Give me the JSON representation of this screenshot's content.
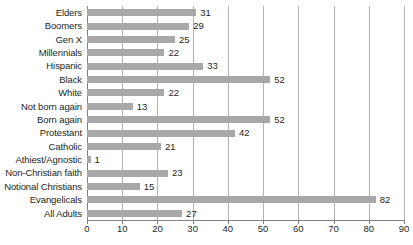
{
  "chart_data": {
    "type": "bar",
    "orientation": "horizontal",
    "title": "",
    "subtitle": "",
    "xlabel": "",
    "ylabel": "",
    "xlim": [
      0,
      90
    ],
    "xticks": [
      0,
      10,
      20,
      30,
      40,
      50,
      60,
      70,
      80,
      90
    ],
    "grid": true,
    "legend": false,
    "bar_color": "#a8a8a8",
    "text_color": "#231f20",
    "gridline_color": "#b3b3b3",
    "axis_color": "#808080",
    "categories": [
      "Elders",
      "Boomers",
      "Gen X",
      "Millennials",
      "Hispanic",
      "Black",
      "White",
      "Not born again",
      "Born again",
      "Protestant",
      "Catholic",
      "Athiest/Agnostic",
      "Non-Christian faith",
      "Notional Christians",
      "Evangelicals",
      "All Adults"
    ],
    "values": [
      31,
      29,
      25,
      22,
      33,
      52,
      22,
      13,
      52,
      42,
      21,
      1,
      23,
      15,
      82,
      27
    ],
    "value_labels": [
      "31",
      "29",
      "25",
      "22",
      "33",
      "52",
      "22",
      "13",
      "52",
      "42",
      "21",
      "1",
      "23",
      "15",
      "82",
      "27"
    ],
    "xtick_labels": [
      "0",
      "10",
      "20",
      "30",
      "40",
      "50",
      "60",
      "70",
      "80",
      "90"
    ]
  }
}
